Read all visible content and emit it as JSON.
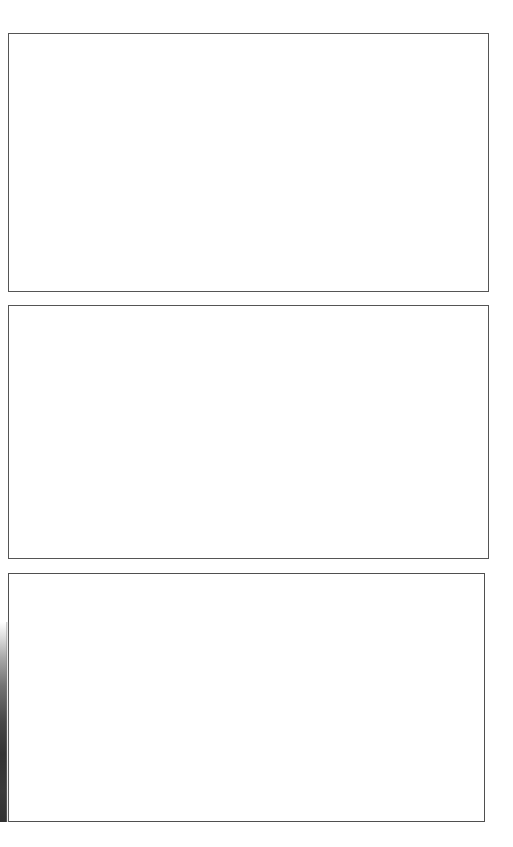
{
  "page": {
    "background_color": "#ffffff",
    "width": 513,
    "height": 847,
    "title": "",
    "text_content": ""
  },
  "panels": [
    {
      "id": "panel-1",
      "label": "",
      "content": "",
      "border_color": "#555555",
      "fill_color": "#ffffff"
    },
    {
      "id": "panel-2",
      "label": "",
      "content": "",
      "border_color": "#555555",
      "fill_color": "#ffffff"
    },
    {
      "id": "panel-3",
      "label": "",
      "content": "",
      "border_color": "#4f4f4f",
      "fill_color": "#ffffff"
    }
  ],
  "artifact": {
    "name": "left-edge-shadow",
    "color_light": "#bebebe",
    "color_dark": "#343434"
  }
}
